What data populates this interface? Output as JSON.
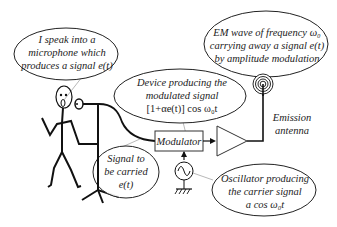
{
  "diagram": {
    "type": "amplitude-modulation-transmitter-illustration",
    "bubbles": {
      "speaker": {
        "lines": [
          "I speak into a",
          "microphone  which",
          "produces a signal e(t)"
        ]
      },
      "device": {
        "lines": [
          "Device producing the",
          "modulated signal",
          "[1+αe(t)] cos ω₀t"
        ]
      },
      "em_wave": {
        "lines": [
          "EM wave of frequency ω₀",
          "carrying away a signal e(t)",
          "by amplitude modulation"
        ]
      },
      "signal": {
        "lines": [
          "Signal to",
          "be carried",
          "e(t)"
        ]
      },
      "oscillator": {
        "lines": [
          "Oscillator producing",
          "the carrier signal",
          "a cos ω₀t"
        ]
      }
    },
    "blocks": {
      "modulator": {
        "label": "Modulator"
      },
      "amplifier": {
        "label": ""
      }
    },
    "labels": {
      "antenna": [
        "Emission",
        "antenna"
      ]
    },
    "icons": {
      "person": "stick-figure",
      "microphone": "microphone-icon",
      "oscillator": "sine-source-icon",
      "ground": "ground-icon",
      "antenna": "concentric-circles-antenna-icon"
    },
    "colors": {
      "line": "#111111",
      "text": "#222222",
      "pointer": "#888888",
      "background": "#ffffff"
    }
  }
}
